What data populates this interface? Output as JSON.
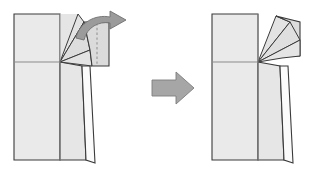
{
  "figure": {
    "type": "origami-fold-diagram",
    "title": "",
    "background_color": "#ffffff",
    "panels": [
      {
        "id": "before",
        "label": "before-fold",
        "description": "Square paper base with a narrow tapered leg flap on the right and a small rectangular flap at top right that is about to be folded down",
        "has_dashed_fold_line": true,
        "has_curved_action_arrow": true
      },
      {
        "id": "after",
        "label": "after-fold",
        "description": "Same base with the top right flap folded down against the body",
        "has_dashed_fold_line": false,
        "has_curved_action_arrow": false
      }
    ],
    "step_arrow": {
      "name": "step-arrow",
      "direction": "right",
      "style": "solid block arrow",
      "color": "#a6a6a6",
      "outline_color": "#7d7d7d"
    },
    "curved_arrow": {
      "name": "fold-arrow",
      "direction": "up-right sweep",
      "style": "curved tapered arrow",
      "color": "#9b9b9b",
      "outline_color": "#6f6f6f"
    },
    "colors": {
      "paper_light": "#ebeaea",
      "paper_mid": "#e2e1e1",
      "paper_dark": "#d6d5d5",
      "paper_white": "#fbfbfb",
      "outline": "#3a3a3a",
      "crease": "#8b8b8b",
      "dashed_fold": "#9a9a9a"
    }
  }
}
